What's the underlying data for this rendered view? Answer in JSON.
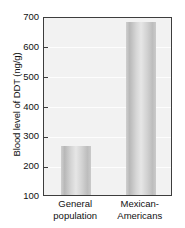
{
  "chart_data": {
    "type": "bar",
    "title": "",
    "subtitle": "",
    "xlabel": "",
    "ylabel": "Blood level of DDT (ng/g)",
    "categories": [
      "General population",
      "Mexican-Americans"
    ],
    "category_lines": [
      [
        "General",
        "population"
      ],
      [
        "Mexican-",
        "Americans"
      ]
    ],
    "values": [
      265,
      680
    ],
    "ylim": [
      100,
      700
    ],
    "yticks": [
      100,
      200,
      300,
      400,
      500,
      600,
      700
    ],
    "ytick_labels": [
      "100",
      "200",
      "300",
      "400",
      "500",
      "600",
      "700"
    ],
    "grid": true,
    "legend": false,
    "units": "ng/g",
    "colors": {
      "bar_fill": "#d2d2d2",
      "bar_edge": "#b8b8b8",
      "plot_background": "#f2f2f2",
      "axis": "#3d3d3d",
      "gridline": "#fdfdfd",
      "text": "#111111",
      "page_background": "#ffffff"
    }
  }
}
